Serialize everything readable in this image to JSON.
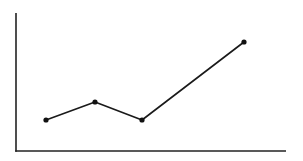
{
  "chart_data": {
    "type": "line",
    "title": "",
    "xlabel": "",
    "ylabel": "",
    "x": [
      30,
      79,
      126,
      228
    ],
    "values": [
      31,
      49,
      31,
      109
    ],
    "series": [
      {
        "name": "",
        "x": [
          30,
          79,
          126,
          228
        ],
        "values": [
          31,
          49,
          31,
          109
        ]
      }
    ],
    "xlim": [
      0,
      270
    ],
    "ylim": [
      0,
      138
    ],
    "grid": false,
    "legend": null,
    "tick_labels": {
      "x": [],
      "y": []
    },
    "markers": true,
    "colors": {
      "line": "#1a1a1a",
      "marker": "#111111",
      "axis": "#222222",
      "background": "#ffffff"
    }
  },
  "layout": {
    "origin": [
      16,
      151
    ],
    "x_axis_end": 286,
    "y_axis_top": 13,
    "line_width": 1.6,
    "marker_radius": 2.6,
    "axis_width": 1.6
  }
}
